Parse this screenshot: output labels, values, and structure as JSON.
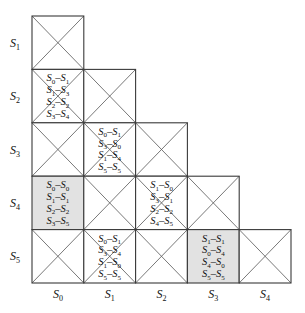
{
  "row_labels": [
    {
      "base": "S",
      "sub": "1"
    },
    {
      "base": "S",
      "sub": "2"
    },
    {
      "base": "S",
      "sub": "3"
    },
    {
      "base": "S",
      "sub": "4"
    },
    {
      "base": "S",
      "sub": "5"
    }
  ],
  "col_labels": [
    {
      "base": "S",
      "sub": "0"
    },
    {
      "base": "S",
      "sub": "1"
    },
    {
      "base": "S",
      "sub": "2"
    },
    {
      "base": "S",
      "sub": "3"
    },
    {
      "base": "S",
      "sub": "4"
    }
  ],
  "cells": [
    {
      "row": 0,
      "col": 0,
      "shaded": false,
      "crossed": true,
      "pairs": []
    },
    {
      "row": 1,
      "col": 0,
      "shaded": false,
      "crossed": true,
      "pairs": [
        [
          "0",
          "1"
        ],
        [
          "1",
          "3"
        ],
        [
          "2",
          "2"
        ],
        [
          "3",
          "4"
        ]
      ]
    },
    {
      "row": 1,
      "col": 1,
      "shaded": false,
      "crossed": true,
      "pairs": []
    },
    {
      "row": 2,
      "col": 0,
      "shaded": false,
      "crossed": true,
      "pairs": []
    },
    {
      "row": 2,
      "col": 1,
      "shaded": false,
      "crossed": true,
      "pairs": [
        [
          "0",
          "1"
        ],
        [
          "3",
          "0"
        ],
        [
          "1",
          "4"
        ],
        [
          "5",
          "5"
        ]
      ]
    },
    {
      "row": 2,
      "col": 2,
      "shaded": false,
      "crossed": true,
      "pairs": []
    },
    {
      "row": 3,
      "col": 0,
      "shaded": true,
      "crossed": false,
      "pairs": [
        [
          "0",
          "0"
        ],
        [
          "1",
          "1"
        ],
        [
          "2",
          "2"
        ],
        [
          "3",
          "5"
        ]
      ]
    },
    {
      "row": 3,
      "col": 1,
      "shaded": false,
      "crossed": true,
      "pairs": []
    },
    {
      "row": 3,
      "col": 2,
      "shaded": false,
      "crossed": true,
      "pairs": [
        [
          "1",
          "0"
        ],
        [
          "3",
          "1"
        ],
        [
          "2",
          "2"
        ],
        [
          "4",
          "5"
        ]
      ]
    },
    {
      "row": 3,
      "col": 3,
      "shaded": false,
      "crossed": true,
      "pairs": []
    },
    {
      "row": 4,
      "col": 0,
      "shaded": false,
      "crossed": true,
      "pairs": []
    },
    {
      "row": 4,
      "col": 1,
      "shaded": false,
      "crossed": true,
      "pairs": [
        [
          "0",
          "1"
        ],
        [
          "3",
          "4"
        ],
        [
          "1",
          "0"
        ],
        [
          "5",
          "5"
        ]
      ]
    },
    {
      "row": 4,
      "col": 2,
      "shaded": false,
      "crossed": true,
      "pairs": []
    },
    {
      "row": 4,
      "col": 3,
      "shaded": true,
      "crossed": false,
      "pairs": [
        [
          "1",
          "1"
        ],
        [
          "0",
          "4"
        ],
        [
          "4",
          "0"
        ],
        [
          "5",
          "5"
        ]
      ]
    },
    {
      "row": 4,
      "col": 4,
      "shaded": false,
      "crossed": true,
      "pairs": []
    }
  ],
  "colors": {
    "shaded": "#e2e2e2",
    "border": "#3a3a3a",
    "cross": "#555555"
  }
}
